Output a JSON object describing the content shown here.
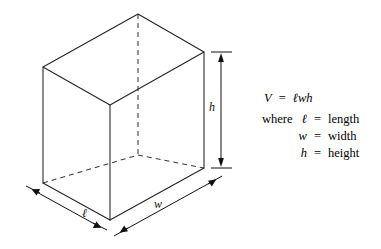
{
  "figure": {
    "kind": "geometry-diagram",
    "background_color": "#ffffff",
    "line_color": "#232323",
    "hidden_line_color": "#3a3a3a",
    "dimension_color": "#111111"
  },
  "dimensions": {
    "height_label": "h",
    "length_label": "ℓ",
    "width_label": "w"
  },
  "formula": {
    "volume_symbol": "V",
    "equals": "=",
    "expression": "ℓwh",
    "where_word": "where",
    "definitions": [
      {
        "symbol": "ℓ",
        "equals": "=",
        "word": "length"
      },
      {
        "symbol": "w",
        "equals": "=",
        "word": "width"
      },
      {
        "symbol": "h",
        "equals": "=",
        "word": "height"
      }
    ]
  },
  "geometry": {
    "top_face": {
      "left": {
        "x": 43,
        "y": 67
      },
      "back": {
        "x": 138,
        "y": 14
      },
      "right": {
        "x": 204,
        "y": 52
      },
      "front": {
        "x": 110,
        "y": 105
      }
    },
    "bottom_face": {
      "left": {
        "x": 43,
        "y": 183
      },
      "back": {
        "x": 138,
        "y": 155
      },
      "right": {
        "x": 204,
        "y": 168
      },
      "front": {
        "x": 110,
        "y": 220
      }
    }
  }
}
